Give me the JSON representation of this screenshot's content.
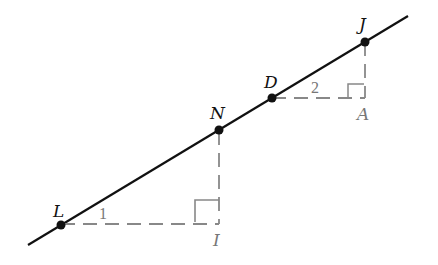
{
  "diagram": {
    "type": "geometry",
    "colors": {
      "line": "#111111",
      "dashed": "#888888",
      "label_dark": "#111111",
      "label_gray": "#777777"
    },
    "points": {
      "L": {
        "label": "L",
        "x": 61,
        "y": 225
      },
      "N": {
        "label": "N",
        "x": 219,
        "y": 130
      },
      "D": {
        "label": "D",
        "x": 272,
        "y": 98
      },
      "J": {
        "label": "J",
        "x": 365,
        "y": 42
      },
      "I": {
        "label": "I",
        "x": 219,
        "y": 223
      },
      "A": {
        "label": "A",
        "x": 365,
        "y": 98
      }
    },
    "angles": {
      "angle1": {
        "label": "1"
      },
      "angle2": {
        "label": "2"
      }
    }
  }
}
